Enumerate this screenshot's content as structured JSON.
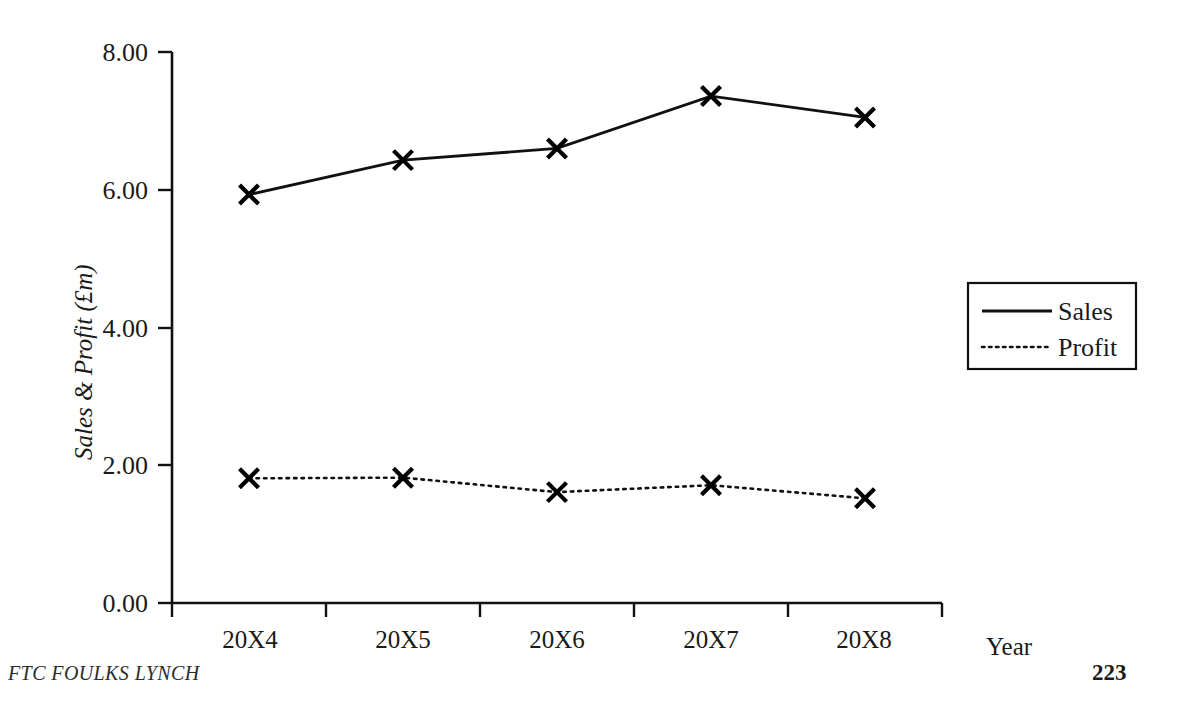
{
  "document": {
    "footer_left": "FTC FOULKS LYNCH",
    "page_number": "223"
  },
  "chart_data": {
    "type": "line",
    "title": "",
    "xlabel": "Year",
    "ylabel": "Sales & Profit (£m)",
    "categories": [
      "20X4",
      "20X5",
      "20X6",
      "20X7",
      "20X8"
    ],
    "series": [
      {
        "name": "Sales",
        "values": [
          5.93,
          6.43,
          6.6,
          7.36,
          7.05
        ],
        "line_style": "solid",
        "marker": "x",
        "color": "#000000"
      },
      {
        "name": "Profit",
        "values": [
          1.81,
          1.82,
          1.61,
          1.71,
          1.52
        ],
        "line_style": "dotted",
        "marker": "x",
        "color": "#000000"
      }
    ],
    "ylim": [
      0,
      8
    ],
    "yticks": [
      "0.00",
      "2.00",
      "4.00",
      "6.00",
      "8.00"
    ],
    "ytick_values": [
      0,
      2,
      4,
      6,
      8
    ],
    "grid": false,
    "legend_position": "right"
  },
  "legend": {
    "entries": [
      {
        "label": "Sales",
        "style": "solid"
      },
      {
        "label": "Profit",
        "style": "dotted"
      }
    ]
  }
}
